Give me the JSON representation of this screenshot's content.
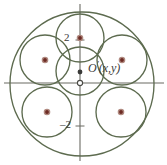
{
  "figure": {
    "type": "geometry-diagram",
    "width": 167,
    "height": 165,
    "background": "#ffffff"
  },
  "colors": {
    "curve_stroke": "#5d6b4f",
    "axis_stroke": "#6b6b63",
    "point_fill": "#6d2b24",
    "point_halo": "#b08a80",
    "label_text": "#3a3a38"
  },
  "axes": {
    "x_axis": {
      "name": "x-axis",
      "y": 83,
      "x1": 4,
      "x2": 164
    },
    "y_axis": {
      "name": "y-axis",
      "x": 80,
      "y1": 4,
      "y2": 161
    },
    "origin": {
      "x": 80,
      "y": 83,
      "marker": "open-circle"
    },
    "ticks": [
      {
        "label": "2",
        "axis": "y",
        "value": 2,
        "x": 80,
        "y": 40,
        "label_x": 64,
        "label_y": 34
      },
      {
        "label": "–2",
        "axis": "y",
        "value": -2,
        "x": 80,
        "y": 126,
        "label_x": 61,
        "label_y": 120
      }
    ]
  },
  "labels": {
    "origin_point": {
      "text_main": "O",
      "text_prime": "′",
      "text_coords": "(x,y)",
      "full": "O′(x,y)",
      "x": 89,
      "y": 66
    }
  },
  "circles": {
    "outer": {
      "name": "outer-bounding-circle",
      "cx": 82,
      "cy": 84,
      "r": 72
    },
    "center": {
      "name": "central-circle",
      "cx": 80,
      "cy": 71,
      "r": 24
    },
    "satellites": [
      {
        "name": "circle-top",
        "cx": 80,
        "cy": 38,
        "r": 24
      },
      {
        "name": "circle-upper-left",
        "cx": 45,
        "cy": 60,
        "r": 25
      },
      {
        "name": "circle-upper-right",
        "cx": 122,
        "cy": 60,
        "r": 25
      },
      {
        "name": "circle-lower-left",
        "cx": 47,
        "cy": 112,
        "r": 25
      },
      {
        "name": "circle-lower-right",
        "cx": 121,
        "cy": 112,
        "r": 25
      }
    ]
  },
  "points": [
    {
      "name": "point-circle-top-center",
      "cx": 80,
      "cy": 38
    },
    {
      "name": "point-circle-upper-left-center",
      "cx": 45,
      "cy": 60
    },
    {
      "name": "point-circle-upper-right-center",
      "cx": 122,
      "cy": 60
    },
    {
      "name": "point-circle-lower-left-center",
      "cx": 47,
      "cy": 112
    },
    {
      "name": "point-circle-lower-right-center",
      "cx": 121,
      "cy": 112
    },
    {
      "name": "point-o-prime",
      "cx": 80,
      "cy": 72
    }
  ]
}
